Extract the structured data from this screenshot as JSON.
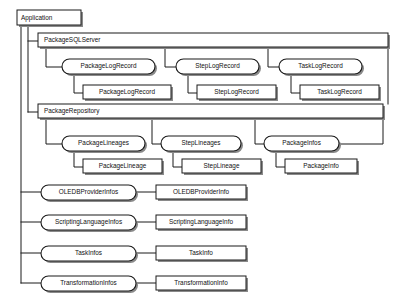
{
  "diagram": {
    "title": "Application",
    "type": "object-model-hierarchy",
    "root": {
      "label": "Application"
    },
    "containers": [
      {
        "label": "PackageSQLServer"
      },
      {
        "label": "PackageRepository"
      }
    ],
    "collections": {
      "package_sql_server": [
        {
          "collection": "PackageLogRecord",
          "item": "PackageLogRecord"
        },
        {
          "collection": "StepLogRecord",
          "item": "StepLogRecord"
        },
        {
          "collection": "TaskLogRecord",
          "item": "TaskLogRecord"
        }
      ],
      "package_repository": [
        {
          "collection": "PackageLineages",
          "item": "PackageLineage"
        },
        {
          "collection": "StepLineages",
          "item": "StepLineage"
        },
        {
          "collection": "PackageInfos",
          "item": "PackageInfo"
        }
      ],
      "application_level": [
        {
          "collection": "OLEDBProviderInfos",
          "item": "OLEDBProviderInfo"
        },
        {
          "collection": "ScriptingLanguageInfos",
          "item": "ScriptingLanguageInfo"
        },
        {
          "collection": "TaskInfos",
          "item": "TaskInfo"
        },
        {
          "collection": "TransformationInfos",
          "item": "TransformationInfo"
        }
      ]
    },
    "colors": {
      "stroke": "#1a1a1a",
      "fill": "#ffffff",
      "shadow": "#8a8a8a",
      "background": "#ffffff"
    }
  }
}
